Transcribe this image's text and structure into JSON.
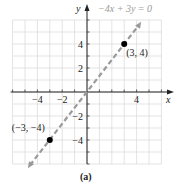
{
  "chart_data": {
    "type": "line",
    "title": "",
    "caption": "(a)",
    "xlabel": "x",
    "ylabel": "y",
    "xlim": [
      -6,
      6
    ],
    "ylim": [
      -6,
      6
    ],
    "grid": true,
    "x_ticks": [
      -4,
      -2,
      4
    ],
    "y_ticks": [
      4,
      2,
      -2,
      -4
    ],
    "x_tick_labels": [
      "−4",
      "−2",
      "4"
    ],
    "y_tick_labels": [
      "4",
      "2",
      "−2",
      "−4"
    ],
    "series": [
      {
        "name": "−4x + 3y = 0",
        "style": "dashed",
        "color": "#999999",
        "x": [
          -6,
          6
        ],
        "y": [
          -8,
          8
        ]
      }
    ],
    "points": [
      {
        "x": 3,
        "y": 4,
        "label": "(3, 4)"
      },
      {
        "x": -3,
        "y": -4,
        "label": "(−3, −4)"
      }
    ],
    "equation_label": "−4x + 3y = 0"
  }
}
